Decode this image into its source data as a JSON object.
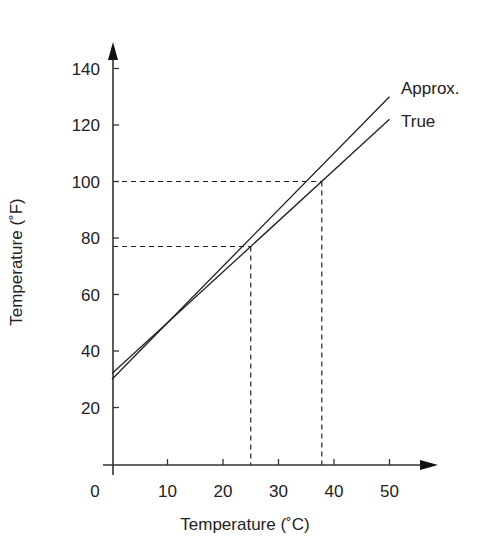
{
  "chart_data": {
    "type": "line",
    "title": "",
    "xlabel": "Temperature (˚C)",
    "ylabel": "Temperature (˚F)",
    "xlim": [
      0,
      55
    ],
    "ylim": [
      0,
      150
    ],
    "x_ticks": [
      0,
      10,
      20,
      30,
      40,
      50
    ],
    "x_tick_labels": [
      "0",
      "10",
      "20",
      "30",
      "40",
      "50"
    ],
    "y_ticks": [
      20,
      40,
      60,
      80,
      100,
      120,
      140
    ],
    "y_tick_labels": [
      "20",
      "40",
      "60",
      "80",
      "100",
      "120",
      "140"
    ],
    "grid": false,
    "legend_position": "inline-right",
    "series": [
      {
        "name": "Approx.",
        "x": [
          0,
          50
        ],
        "y": [
          30,
          130
        ]
      },
      {
        "name": "True",
        "x": [
          0,
          50
        ],
        "y": [
          32,
          122
        ]
      }
    ],
    "annotations": [
      {
        "type": "dashed-guide",
        "x": 25,
        "y": 77
      },
      {
        "type": "dashed-guide",
        "x": 37.8,
        "y": 100
      }
    ]
  }
}
